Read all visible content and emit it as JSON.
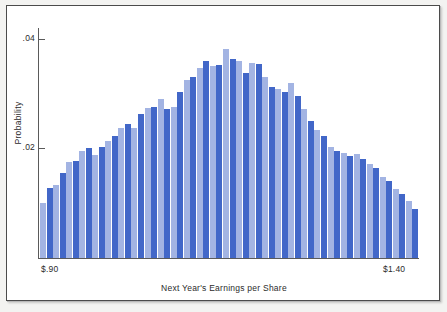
{
  "chart_data": {
    "type": "bar",
    "title": "",
    "xlabel": "Next Year's Earnings per Share",
    "ylabel": "Probability",
    "ytick_labels": [
      ".04",
      ".02"
    ],
    "ytick_values": [
      0.04,
      0.02
    ],
    "ylim": [
      0.0,
      0.042
    ],
    "xtick_labels": [
      "$.90",
      "$1.40"
    ],
    "xlim": [
      0.9,
      1.4
    ],
    "grid": false,
    "legend": null,
    "bar_colors": {
      "dark": "#4267c8",
      "light": "#a3b4e3"
    },
    "note": "Alternating dark/light blue bars form a single histogram series of 47 bins from $.90 to $1.40.",
    "categories": [
      "$0.900",
      "$0.911",
      "$0.921",
      "$0.932",
      "$0.943",
      "$0.953",
      "$0.964",
      "$0.974",
      "$0.985",
      "$0.996",
      "$1.006",
      "$1.017",
      "$1.028",
      "$1.038",
      "$1.049",
      "$1.060",
      "$1.070",
      "$1.081",
      "$1.091",
      "$1.102",
      "$1.113",
      "$1.123",
      "$1.134",
      "$1.145",
      "$1.155",
      "$1.166",
      "$1.176",
      "$1.187",
      "$1.198",
      "$1.208",
      "$1.219",
      "$1.230",
      "$1.240",
      "$1.251",
      "$1.261",
      "$1.272",
      "$1.283",
      "$1.293",
      "$1.304",
      "$1.315",
      "$1.325",
      "$1.336",
      "$1.346",
      "$1.357",
      "$1.368",
      "$1.378",
      "$1.389"
    ],
    "values": [
      0.01,
      0.0128,
      0.0133,
      0.0155,
      0.0175,
      0.0178,
      0.0196,
      0.02,
      0.0188,
      0.0203,
      0.0213,
      0.0222,
      0.0238,
      0.0245,
      0.0237,
      0.0263,
      0.0274,
      0.0275,
      0.029,
      0.0273,
      0.0276,
      0.0303,
      0.0325,
      0.033,
      0.0347,
      0.036,
      0.035,
      0.0352,
      0.0382,
      0.0363,
      0.036,
      0.0337,
      0.0357,
      0.0355,
      0.033,
      0.0312,
      0.0308,
      0.0304,
      0.032,
      0.0296,
      0.0272,
      0.025,
      0.0233,
      0.0222,
      0.0203,
      0.0196,
      0.0192
    ],
    "values_tail": [
      0.0187,
      0.019,
      0.0181,
      0.0172,
      0.0165,
      0.0148,
      0.014,
      0.0126,
      0.0117,
      0.0104,
      0.009
    ]
  }
}
